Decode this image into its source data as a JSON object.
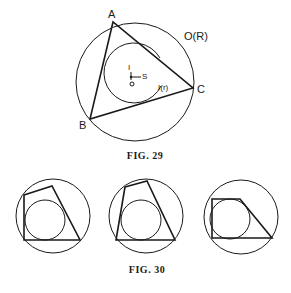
{
  "fig29": {
    "caption": "FIG. 29",
    "circumcircle": {
      "label": "O(R)",
      "cx": 135,
      "cy": 82,
      "r": 59
    },
    "incircle": {
      "label": "I(r)",
      "cx": 132,
      "cy": 74,
      "r": 30
    },
    "vertices": {
      "A": {
        "label": "A",
        "x": 113,
        "y": 22
      },
      "B": {
        "label": "B",
        "x": 90,
        "y": 119
      },
      "C": {
        "label": "C",
        "x": 193,
        "y": 88
      }
    },
    "center_points": {
      "I": {
        "label": "I",
        "x": 131,
        "y": 72
      },
      "S": {
        "label": "S",
        "x": 141,
        "y": 76
      },
      "O": {
        "label": "O",
        "x": 132,
        "y": 84
      }
    }
  },
  "fig30": {
    "caption": "FIG. 30",
    "panels": [
      {
        "circumcircle": {
          "cx": 53,
          "cy": 216,
          "r": 37
        },
        "incircle": {
          "cx": 45,
          "cy": 220,
          "r": 20
        },
        "quad": "24,195 52,186 80,240 24,240"
      },
      {
        "circumcircle": {
          "cx": 146,
          "cy": 216,
          "r": 37
        },
        "incircle": {
          "cx": 141,
          "cy": 220,
          "r": 20
        },
        "quad": "125,187 147,181 175,240 116,240"
      },
      {
        "circumcircle": {
          "cx": 241,
          "cy": 217,
          "r": 37
        },
        "incircle": {
          "cx": 230,
          "cy": 219,
          "r": 20
        },
        "quad": "212,199 240,199 272,238 212,238"
      }
    ]
  }
}
